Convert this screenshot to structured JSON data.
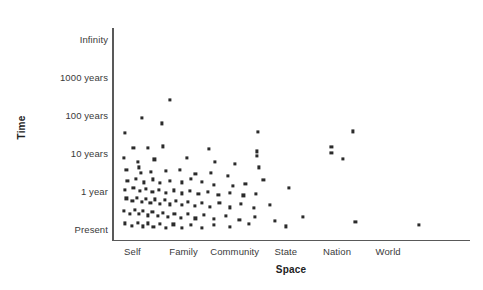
{
  "chart_data": {
    "type": "scatter",
    "title": "",
    "xlabel": "Space",
    "ylabel": "Time",
    "grid": false,
    "legend": null,
    "x_tick_labels": [
      "Self",
      "Family",
      "Community",
      "State",
      "Nation",
      "World"
    ],
    "x_tick_positions": [
      1,
      2,
      3,
      4,
      5,
      6
    ],
    "y_tick_labels": [
      "Present",
      "1 year",
      "10 years",
      "100 years",
      "1000 years",
      "Infinity"
    ],
    "y_tick_positions": [
      0,
      1,
      2,
      3,
      4,
      5
    ],
    "xlim": [
      0.6,
      7.6
    ],
    "ylim": [
      -0.3,
      5.3
    ],
    "marker": "square",
    "marker_color": "#2b2b2b",
    "points": [
      [
        1.73,
        3.39
      ],
      [
        1.18,
        2.93
      ],
      [
        1.57,
        2.78
      ],
      [
        5.31,
        2.57
      ],
      [
        0.85,
        2.52
      ],
      [
        3.45,
        2.56
      ],
      [
        4.89,
        2.15
      ],
      [
        4.89,
        2.01
      ],
      [
        1.02,
        2.13
      ],
      [
        1.31,
        2.13
      ],
      [
        1.6,
        2.17
      ],
      [
        2.49,
        2.1
      ],
      [
        3.43,
        2.04
      ],
      [
        3.43,
        1.93
      ],
      [
        5.12,
        1.84
      ],
      [
        0.83,
        1.86
      ],
      [
        1.1,
        1.77
      ],
      [
        1.13,
        1.62
      ],
      [
        1.43,
        1.83
      ],
      [
        2.06,
        1.86
      ],
      [
        2.61,
        1.77
      ],
      [
        3.01,
        1.7
      ],
      [
        3.47,
        1.62
      ],
      [
        0.88,
        1.55
      ],
      [
        1.16,
        1.47
      ],
      [
        1.36,
        1.5
      ],
      [
        1.66,
        1.53
      ],
      [
        1.93,
        1.55
      ],
      [
        2.23,
        1.45
      ],
      [
        2.54,
        1.47
      ],
      [
        2.86,
        1.4
      ],
      [
        3.56,
        1.29
      ],
      [
        0.9,
        1.26
      ],
      [
        1.07,
        1.32
      ],
      [
        1.23,
        1.22
      ],
      [
        1.4,
        1.3
      ],
      [
        1.54,
        1.2
      ],
      [
        1.74,
        1.27
      ],
      [
        1.96,
        1.22
      ],
      [
        2.14,
        1.31
      ],
      [
        2.36,
        1.24
      ],
      [
        2.6,
        1.16
      ],
      [
        2.97,
        1.12
      ],
      [
        3.21,
        1.19
      ],
      [
        4.06,
        1.07
      ],
      [
        0.86,
        1.03
      ],
      [
        1.02,
        1.08
      ],
      [
        1.14,
        0.99
      ],
      [
        1.27,
        1.05
      ],
      [
        1.39,
        0.96
      ],
      [
        1.52,
        1.03
      ],
      [
        1.66,
        0.95
      ],
      [
        1.81,
        1.01
      ],
      [
        1.97,
        0.93
      ],
      [
        2.12,
        0.99
      ],
      [
        2.29,
        0.92
      ],
      [
        2.47,
        0.97
      ],
      [
        2.68,
        0.9
      ],
      [
        2.91,
        0.95
      ],
      [
        3.17,
        0.88
      ],
      [
        3.42,
        0.92
      ],
      [
        0.88,
        0.8
      ],
      [
        1.0,
        0.74
      ],
      [
        1.09,
        0.82
      ],
      [
        1.18,
        0.71
      ],
      [
        1.26,
        0.79
      ],
      [
        1.35,
        0.68
      ],
      [
        1.44,
        0.77
      ],
      [
        1.54,
        0.66
      ],
      [
        1.63,
        0.75
      ],
      [
        1.74,
        0.64
      ],
      [
        1.85,
        0.73
      ],
      [
        1.97,
        0.62
      ],
      [
        2.09,
        0.71
      ],
      [
        2.22,
        0.6
      ],
      [
        2.36,
        0.69
      ],
      [
        2.52,
        0.58
      ],
      [
        2.7,
        0.67
      ],
      [
        2.9,
        0.56
      ],
      [
        3.12,
        0.65
      ],
      [
        3.38,
        0.54
      ],
      [
        3.68,
        0.62
      ],
      [
        0.84,
        0.47
      ],
      [
        0.95,
        0.4
      ],
      [
        1.04,
        0.49
      ],
      [
        1.13,
        0.38
      ],
      [
        1.21,
        0.46
      ],
      [
        1.3,
        0.35
      ],
      [
        1.39,
        0.44
      ],
      [
        1.49,
        0.33
      ],
      [
        1.59,
        0.42
      ],
      [
        1.7,
        0.31
      ],
      [
        1.82,
        0.4
      ],
      [
        1.94,
        0.29
      ],
      [
        2.08,
        0.38
      ],
      [
        2.23,
        0.27
      ],
      [
        2.4,
        0.36
      ],
      [
        2.6,
        0.25
      ],
      [
        2.83,
        0.34
      ],
      [
        3.09,
        0.23
      ],
      [
        3.4,
        0.32
      ],
      [
        3.78,
        0.21
      ],
      [
        4.33,
        0.3
      ],
      [
        5.36,
        0.18
      ],
      [
        0.86,
        0.14
      ],
      [
        0.99,
        0.08
      ],
      [
        1.1,
        0.16
      ],
      [
        1.2,
        0.06
      ],
      [
        1.3,
        0.14
      ],
      [
        1.41,
        0.04
      ],
      [
        1.53,
        0.12
      ],
      [
        1.66,
        0.03
      ],
      [
        1.8,
        0.11
      ],
      [
        1.96,
        0.02
      ],
      [
        2.14,
        0.1
      ],
      [
        2.35,
        0.01
      ],
      [
        2.6,
        0.09
      ],
      [
        2.9,
        0.05
      ],
      [
        3.28,
        0.12
      ],
      [
        4.0,
        0.06
      ],
      [
        6.6,
        0.09
      ]
    ]
  }
}
